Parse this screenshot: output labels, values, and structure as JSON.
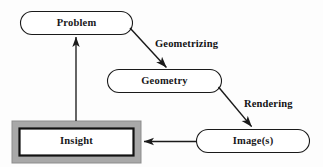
{
  "diagram": {
    "background_color": "#fdfdfd",
    "line_color": "#1a1a1a",
    "frame_fill_color": "#a8a8a8",
    "node_fill_color": "#ffffff",
    "nodes": [
      {
        "id": "problem",
        "label": "Problem",
        "shape": "stadium",
        "x": 20,
        "y": 11,
        "w": 113,
        "h": 24,
        "emphasis": false
      },
      {
        "id": "geometry",
        "label": "Geometry",
        "shape": "stadium",
        "x": 107,
        "y": 69,
        "w": 115,
        "h": 24,
        "emphasis": false
      },
      {
        "id": "images",
        "label": "Image(s)",
        "shape": "stadium",
        "x": 196,
        "y": 129,
        "w": 114,
        "h": 24,
        "emphasis": false
      },
      {
        "id": "insight",
        "label": "Insight",
        "shape": "double-rectangle-gray-frame",
        "x": 12,
        "y": 121,
        "w": 129,
        "h": 42,
        "emphasis": true
      }
    ],
    "edges": [
      {
        "id": "problem-to-geometry",
        "from": "problem",
        "to": "geometry",
        "label": "Geometrizing",
        "label_x": 155,
        "label_y": 39,
        "direction": "down-right",
        "arrow": "single"
      },
      {
        "id": "geometry-to-images",
        "from": "geometry",
        "to": "images",
        "label": "Rendering",
        "label_x": 244,
        "label_y": 99,
        "direction": "down-right",
        "arrow": "single"
      },
      {
        "id": "images-to-insight",
        "from": "images",
        "to": "insight",
        "label": "",
        "direction": "left",
        "arrow": "single"
      },
      {
        "id": "insight-to-problem",
        "from": "insight",
        "to": "problem",
        "label": "",
        "direction": "up",
        "arrow": "single"
      }
    ]
  }
}
